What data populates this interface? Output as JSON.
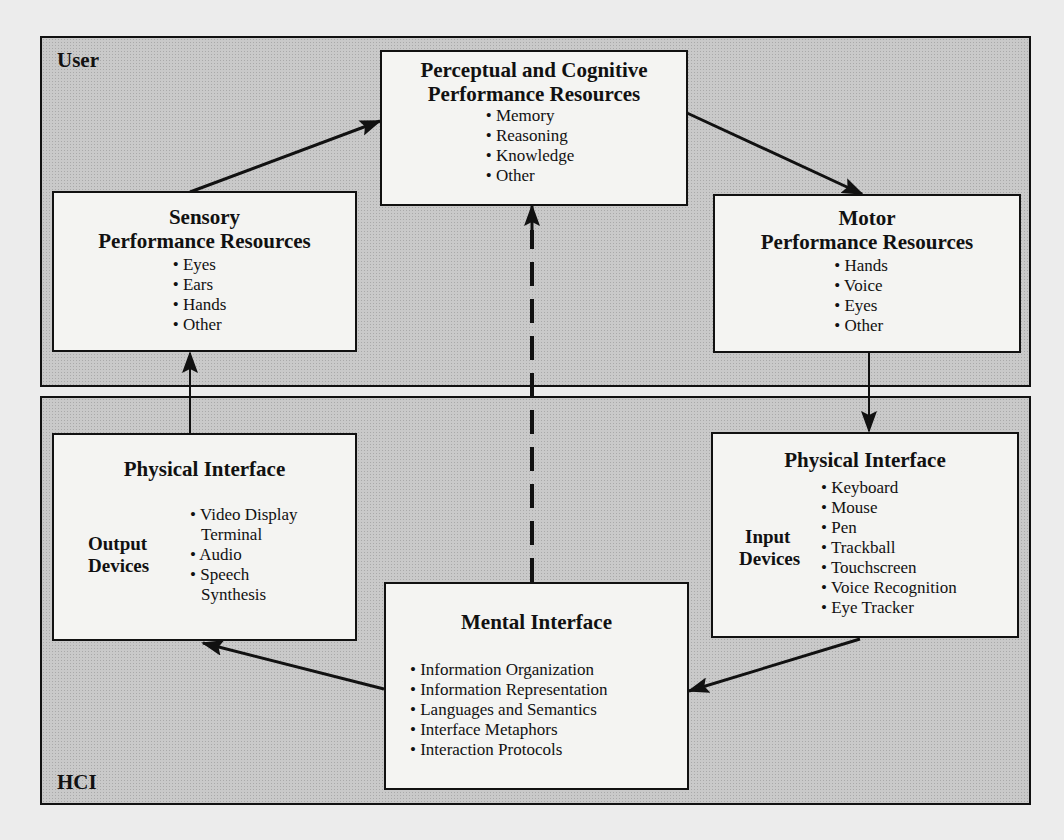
{
  "regions": {
    "user": {
      "label": "User"
    },
    "hci": {
      "label": "HCI"
    }
  },
  "boxes": {
    "perceptual": {
      "title_line1": "Perceptual and Cognitive",
      "title_line2": "Performance Resources",
      "items": [
        "Memory",
        "Reasoning",
        "Knowledge",
        "Other"
      ]
    },
    "sensory": {
      "title_line1": "Sensory",
      "title_line2": "Performance Resources",
      "items": [
        "Eyes",
        "Ears",
        "Hands",
        "Other"
      ]
    },
    "motor": {
      "title_line1": "Motor",
      "title_line2": "Performance Resources",
      "items": [
        "Hands",
        "Voice",
        "Eyes",
        "Other"
      ]
    },
    "physical_output": {
      "title": "Physical Interface",
      "side_label_line1": "Output",
      "side_label_line2": "Devices",
      "items": [
        "Video Display",
        "Terminal",
        "Audio",
        "Speech",
        "Synthesis"
      ]
    },
    "physical_input": {
      "title": "Physical Interface",
      "side_label_line1": "Input",
      "side_label_line2": "Devices",
      "items": [
        "Keyboard",
        "Mouse",
        "Pen",
        "Trackball",
        "Touchscreen",
        "Voice Recognition",
        "Eye Tracker"
      ]
    },
    "mental": {
      "title": "Mental Interface",
      "items": [
        "Information Organization",
        "Information Representation",
        "Languages and Semantics",
        "Interface Metaphors",
        "Interaction Protocols"
      ]
    }
  },
  "connections": [
    {
      "from": "sensory",
      "to": "perceptual",
      "style": "solid"
    },
    {
      "from": "perceptual",
      "to": "motor",
      "style": "solid"
    },
    {
      "from": "motor",
      "to": "physical_input",
      "style": "solid"
    },
    {
      "from": "physical_input",
      "to": "mental",
      "style": "solid"
    },
    {
      "from": "mental",
      "to": "physical_output",
      "style": "solid"
    },
    {
      "from": "physical_output",
      "to": "sensory",
      "style": "solid"
    },
    {
      "from": "mental",
      "to": "perceptual",
      "style": "dashed"
    }
  ]
}
